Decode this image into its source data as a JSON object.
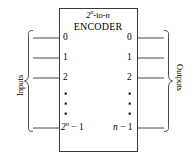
{
  "diagram": {
    "type": "logic-block-diagram",
    "title_top": "2n-to-n",
    "title_main": "ENCODER",
    "colors": {
      "stroke": "#3a3a3a",
      "text": "#000000",
      "background": "#ffffff"
    },
    "left_side": {
      "group_label": "Inputs",
      "ports": [
        {
          "label": "0"
        },
        {
          "label": "1"
        },
        {
          "label": "2"
        },
        {
          "label": "2n − 1"
        }
      ],
      "ellipsis_dots": 3
    },
    "right_side": {
      "group_label": "Outputs",
      "ports": [
        {
          "label": "0"
        },
        {
          "label": "1"
        },
        {
          "label": "2"
        },
        {
          "label": "n − 1"
        }
      ],
      "ellipsis_dots": 3
    }
  }
}
